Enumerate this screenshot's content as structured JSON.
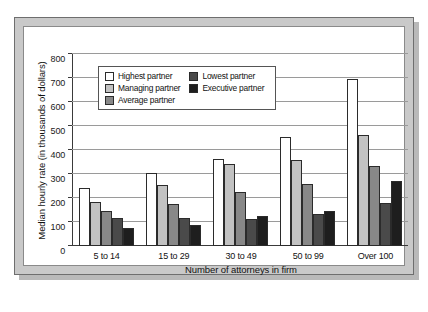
{
  "chart_data": {
    "type": "bar",
    "title": "",
    "xlabel": "Number of attorneys in firm",
    "ylabel": "Median hourly rate (in thousands of dollars)",
    "categories": [
      "5 to 14",
      "15 to 29",
      "30 to 49",
      "50 to 99",
      "Over 100"
    ],
    "ylim": [
      0,
      800
    ],
    "yticks": [
      0,
      100,
      200,
      300,
      400,
      500,
      600,
      700,
      800
    ],
    "ytick_labels": [
      "0",
      "100",
      "200",
      "300",
      "400",
      "500",
      "600",
      "700",
      "800"
    ],
    "grid": true,
    "legend_position": "upper-left-inside",
    "series": [
      {
        "name": "Highest partner",
        "color": "#ffffff",
        "values": [
          240,
          305,
          362,
          455,
          695
        ]
      },
      {
        "name": "Managing partner",
        "color": "#c2c2c2",
        "values": [
          185,
          255,
          340,
          358,
          462
        ]
      },
      {
        "name": "Average partner",
        "color": "#888888",
        "values": [
          145,
          175,
          225,
          260,
          332
        ]
      },
      {
        "name": "Lowest partner",
        "color": "#4a4a4a",
        "values": [
          115,
          118,
          112,
          133,
          180
        ]
      },
      {
        "name": "Executive partner",
        "color": "#1e1e1e",
        "values": [
          75,
          88,
          125,
          145,
          270
        ]
      }
    ]
  },
  "legend": {
    "column_left": [
      "Highest partner",
      "Managing partner",
      "Average partner"
    ],
    "column_right": [
      "Lowest partner",
      "Executive partner"
    ]
  },
  "colors": {
    "frame_band": "#c9c9c9",
    "frame_border": "#6e6e6e",
    "plot_background": "#ffffff",
    "gridline": "#9a9a9a",
    "axis": "#3a3a3a",
    "text": "#111111"
  }
}
